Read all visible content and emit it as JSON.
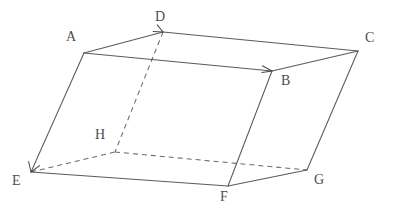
{
  "figure": {
    "canvas": {
      "width": 407,
      "height": 214,
      "background": "#ffffff"
    },
    "style": {
      "solid_stroke": "#5a5a5a",
      "dashed_stroke": "#6a6a6a",
      "label_color": "#4d4d4d",
      "stroke_width": 1.05,
      "dash_pattern": "5 4",
      "label_font_size": 14
    },
    "vertices": [
      {
        "id": "A",
        "label": "A",
        "x": 84,
        "y": 53,
        "hidden": false,
        "label_x": 66,
        "label_y": 30
      },
      {
        "id": "B",
        "label": "B",
        "x": 272,
        "y": 71,
        "hidden": false,
        "label_x": 281,
        "label_y": 74
      },
      {
        "id": "C",
        "label": "C",
        "x": 358,
        "y": 51,
        "hidden": false,
        "label_x": 365,
        "label_y": 31
      },
      {
        "id": "D",
        "label": "D",
        "x": 163,
        "y": 32,
        "hidden": false,
        "label_x": 155,
        "label_y": 10
      },
      {
        "id": "E",
        "label": "E",
        "x": 31,
        "y": 172,
        "hidden": false,
        "label_x": 12,
        "label_y": 174
      },
      {
        "id": "F",
        "label": "F",
        "x": 228,
        "y": 186,
        "hidden": false,
        "label_x": 220,
        "label_y": 190
      },
      {
        "id": "G",
        "label": "G",
        "x": 307,
        "y": 170,
        "hidden": false,
        "label_x": 314,
        "label_y": 173
      },
      {
        "id": "H",
        "label": "H",
        "x": 115,
        "y": 152,
        "hidden": true,
        "label_x": 95,
        "label_y": 128
      }
    ],
    "edges": [
      {
        "id": "AD",
        "from": "A",
        "to": "D",
        "style": "solid",
        "arrow": true
      },
      {
        "id": "DC",
        "from": "D",
        "to": "C",
        "style": "solid",
        "arrow": false
      },
      {
        "id": "AB",
        "from": "A",
        "to": "B",
        "style": "solid",
        "arrow": true
      },
      {
        "id": "BC",
        "from": "B",
        "to": "C",
        "style": "solid",
        "arrow": false
      },
      {
        "id": "AE",
        "from": "A",
        "to": "E",
        "style": "solid",
        "arrow": true
      },
      {
        "id": "BF",
        "from": "B",
        "to": "F",
        "style": "solid",
        "arrow": false
      },
      {
        "id": "CG",
        "from": "C",
        "to": "G",
        "style": "solid",
        "arrow": false
      },
      {
        "id": "DH",
        "from": "D",
        "to": "H",
        "style": "dashed",
        "arrow": false
      },
      {
        "id": "EF",
        "from": "E",
        "to": "F",
        "style": "solid",
        "arrow": false
      },
      {
        "id": "FG",
        "from": "F",
        "to": "G",
        "style": "solid",
        "arrow": false
      },
      {
        "id": "EH",
        "from": "E",
        "to": "H",
        "style": "dashed",
        "arrow": false
      },
      {
        "id": "HG",
        "from": "H",
        "to": "G",
        "style": "dashed",
        "arrow": false
      }
    ],
    "arrow_heads": [
      {
        "id": "arrowhead-ad",
        "at": "D",
        "from": "A"
      },
      {
        "id": "arrowhead-ab",
        "at": "B",
        "from": "A"
      },
      {
        "id": "arrowhead-ae",
        "at": "E",
        "from": "A"
      }
    ]
  }
}
